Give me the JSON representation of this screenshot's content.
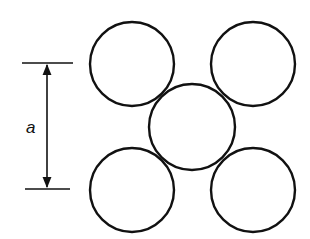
{
  "diagram": {
    "type": "square packing of circles (body-centred arrangement)",
    "dimension": {
      "label": "a",
      "top_y": 63,
      "bottom_y": 189,
      "x": 47
    },
    "circles": [
      {
        "name": "top-left",
        "cx": 132,
        "cy": 64,
        "r": 42
      },
      {
        "name": "top-right",
        "cx": 253,
        "cy": 64,
        "r": 42
      },
      {
        "name": "center",
        "cx": 192,
        "cy": 127,
        "r": 43
      },
      {
        "name": "bottom-left",
        "cx": 132,
        "cy": 190,
        "r": 42
      },
      {
        "name": "bottom-right",
        "cx": 253,
        "cy": 190,
        "r": 42
      }
    ],
    "colors": {
      "stroke": "#111111",
      "background": "#ffffff"
    }
  }
}
